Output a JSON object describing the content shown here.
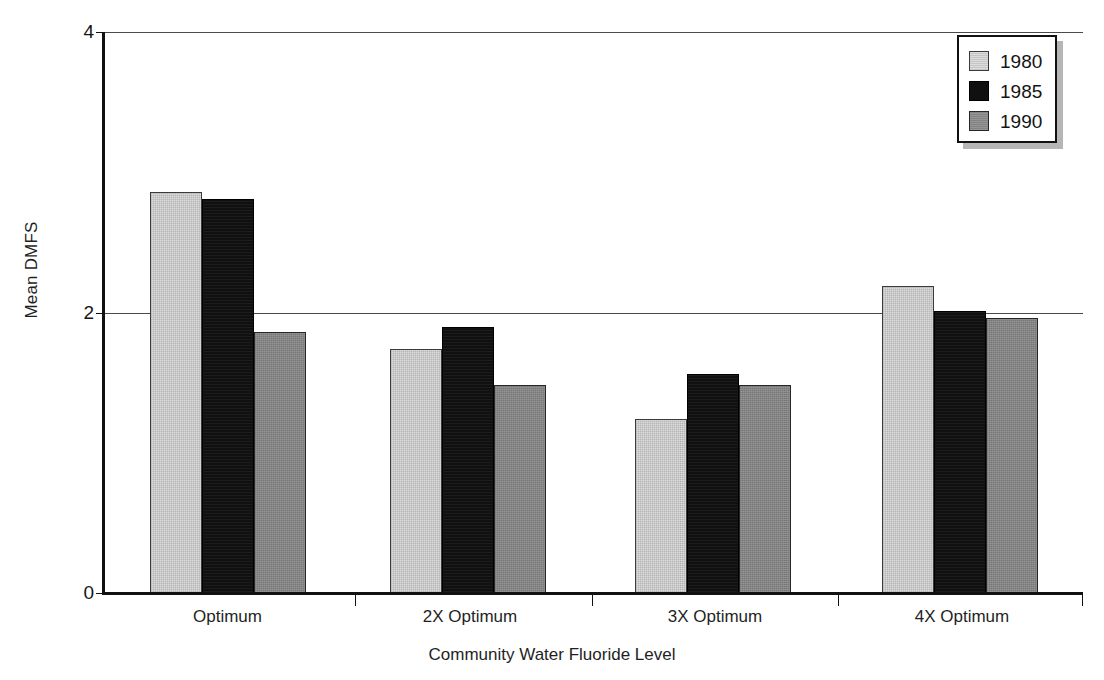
{
  "chart_data": {
    "type": "bar",
    "title": "",
    "xlabel": "Community Water Fluoride Level",
    "ylabel": "Mean DMFS",
    "categories": [
      "Optimum",
      "2X Optimum",
      "3X Optimum",
      "4X Optimum"
    ],
    "series": [
      {
        "name": "1980",
        "color": "#dcdcdc",
        "values": [
          2.86,
          1.74,
          1.24,
          2.19
        ]
      },
      {
        "name": "1985",
        "color": "#101010",
        "values": [
          2.81,
          1.9,
          1.56,
          2.01
        ]
      },
      {
        "name": "1990",
        "color": "#848484",
        "values": [
          1.86,
          1.48,
          1.48,
          1.96
        ]
      }
    ],
    "ylim": [
      0,
      4
    ],
    "yticks": [
      "0",
      "2",
      "4"
    ],
    "ytick_values": [
      0,
      2,
      4
    ],
    "grid": true,
    "gridlines_at": [
      2,
      4
    ],
    "legend_position": "top-right",
    "legend_entries": [
      "1980",
      "1985",
      "1990"
    ]
  },
  "axes": {
    "y_title": "Mean DMFS",
    "x_title": "Community Water Fluoride Level",
    "y_tick_0": "0",
    "y_tick_2": "2",
    "y_tick_4": "4"
  },
  "legend": {
    "entry_1": "1980",
    "entry_2": "1985",
    "entry_3": "1990"
  },
  "x_labels": {
    "cat_1": "Optimum",
    "cat_2": "2X Optimum",
    "cat_3": "3X Optimum",
    "cat_4": "4X Optimum"
  }
}
